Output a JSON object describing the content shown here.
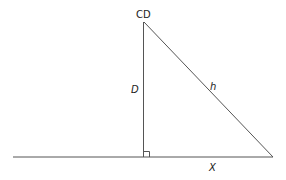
{
  "diagram": {
    "type": "right-triangle",
    "labels": {
      "apex": "CD",
      "vertical_side": "D",
      "hypotenuse": "h",
      "base": "X"
    },
    "colors": {
      "stroke": "#555555",
      "text": "#222222",
      "background": "#ffffff"
    }
  }
}
